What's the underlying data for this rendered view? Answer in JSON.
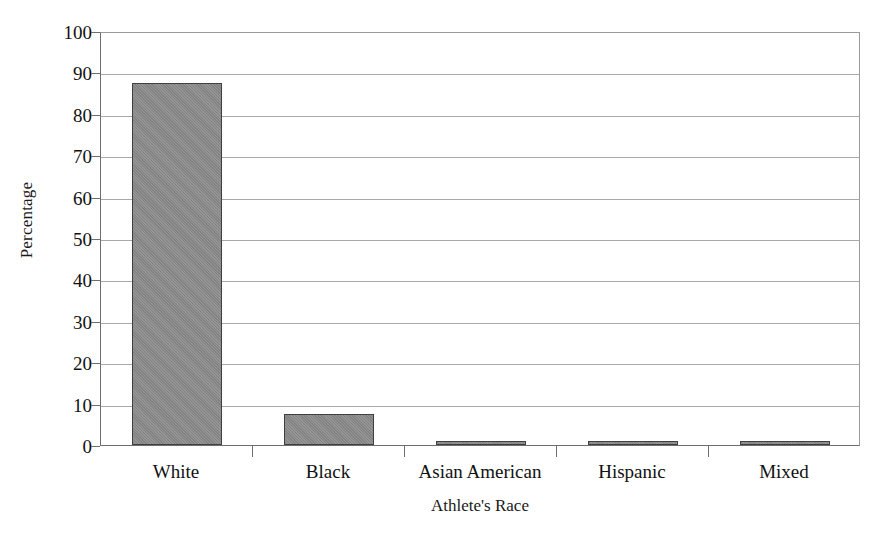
{
  "chart_data": {
    "type": "bar",
    "title": "",
    "subtitle": "",
    "xlabel": "Athlete's Race",
    "ylabel": "Percentage",
    "categories": [
      "White",
      "Black",
      "Asian American",
      "Hispanic",
      "Mixed"
    ],
    "values": [
      87.5,
      7.6,
      0.4,
      0.7,
      1.0
    ],
    "series": [
      {
        "name": "Percentage",
        "values": [
          87.5,
          7.6,
          0.4,
          0.7,
          1.0
        ]
      }
    ],
    "ylim": [
      0,
      100
    ],
    "yticks": [
      0,
      10,
      20,
      30,
      40,
      50,
      60,
      70,
      80,
      90,
      100
    ],
    "ytick_labels": [
      "0",
      "10",
      "20",
      "30",
      "40",
      "50",
      "60",
      "70",
      "80",
      "90",
      "100"
    ],
    "grid": "horizontal",
    "legend": "none",
    "annotations": [],
    "bar_color": "#8a8a8a",
    "bar_border_color": "#3f3f3f",
    "gridline_color": "#a9a9a9",
    "axis_color": "#6e6e6e",
    "background_color": "#ffffff",
    "text_color": "#111111"
  }
}
